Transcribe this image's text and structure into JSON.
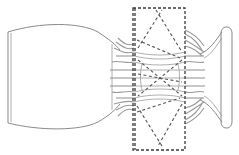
{
  "figure": {
    "type": "line-drawing",
    "parts": [
      {
        "name": "left-bowl",
        "shape": "cup"
      },
      {
        "name": "dashed-region",
        "shape": "rectangle",
        "pattern": "stacked X"
      },
      {
        "name": "strands",
        "shape": "wavy lines"
      },
      {
        "name": "right-foot",
        "shape": "flared base with oval end"
      }
    ],
    "colors": {
      "outline": "#8a8a8a",
      "dashed": "#3a3a3a",
      "background": "#ffffff"
    }
  }
}
